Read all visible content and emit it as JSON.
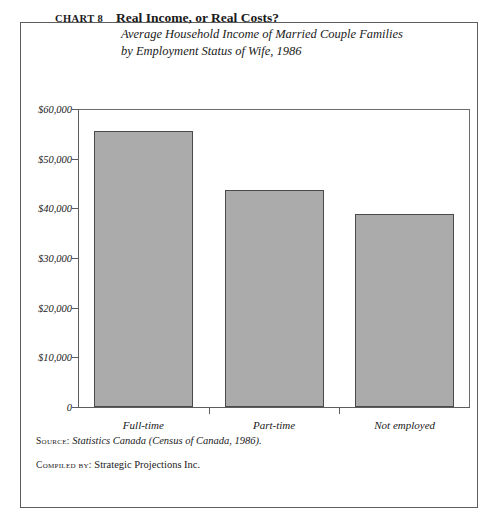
{
  "header": {
    "chart_number": "CHART 8",
    "title": "Real Income, or Real Costs?",
    "subtitle_line1": "Average Household Income of Married Couple Families",
    "subtitle_line2": "by Employment Status of Wife, 1986"
  },
  "footer": {
    "source_key": "Source:",
    "source_value": "Statistics Canada (Census of Canada, 1986).",
    "compiled_key": "Compiled by:",
    "compiled_value": "Strategic Projections Inc."
  },
  "colors": {
    "bar_fill": "#ababab",
    "bar_edge": "#4a4a4a",
    "axis": "#5d5d5d",
    "frame": "#5d5d5d",
    "text": "#1a1a1a",
    "background": "#ffffff"
  },
  "chart_data": {
    "type": "bar",
    "title": "Real Income, or Real Costs?",
    "subtitle": "Average Household Income of Married Couple Families by Employment Status of Wife, 1986",
    "xlabel": "",
    "ylabel": "",
    "categories": [
      "Full-time",
      "Part-time",
      "Not employed"
    ],
    "values": [
      55500,
      43700,
      38800
    ],
    "ylim": [
      0,
      60000
    ],
    "ytick_values": [
      0,
      10000,
      20000,
      30000,
      40000,
      50000,
      60000
    ],
    "ytick_labels": [
      "0",
      "$10,000",
      "$20,000",
      "$30,000",
      "$40,000",
      "$50,000",
      "$60,000"
    ],
    "grid": false,
    "legend": false,
    "series": [
      {
        "name": "Average household income",
        "values": [
          55500,
          43700,
          38800
        ]
      }
    ]
  }
}
